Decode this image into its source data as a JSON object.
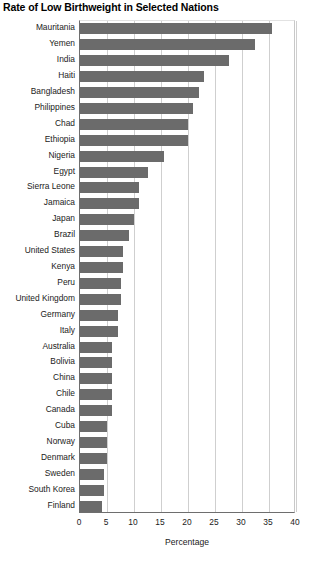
{
  "chart_data": {
    "type": "bar",
    "orientation": "horizontal",
    "title": "Rate of Low Birthweight in Selected Nations",
    "xlabel": "Percentage",
    "ylabel": "",
    "xlim": [
      0,
      40
    ],
    "xticks": [
      0,
      5,
      10,
      15,
      20,
      25,
      30,
      35,
      40
    ],
    "grid": true,
    "legend": null,
    "bar_color": "#6b6b6b",
    "categories": [
      "Mauritania",
      "Yemen",
      "India",
      "Haiti",
      "Bangladesh",
      "Philippines",
      "Chad",
      "Ethiopia",
      "Nigeria",
      "Egypt",
      "Sierra Leone",
      "Jamaica",
      "Japan",
      "Brazil",
      "United States",
      "Kenya",
      "Peru",
      "United Kingdom",
      "Germany",
      "Italy",
      "Australia",
      "Bolivia",
      "China",
      "Chile",
      "Canada",
      "Cuba",
      "Norway",
      "Denmark",
      "Sweden",
      "South Korea",
      "Finland"
    ],
    "values": [
      35.5,
      32.4,
      27.5,
      23,
      22,
      21,
      20,
      20,
      15.5,
      12.5,
      11,
      11,
      10,
      9,
      8,
      8,
      7.5,
      7.5,
      7,
      7,
      6,
      6,
      6,
      6,
      6,
      5,
      5,
      5,
      4.5,
      4.5,
      4
    ]
  }
}
